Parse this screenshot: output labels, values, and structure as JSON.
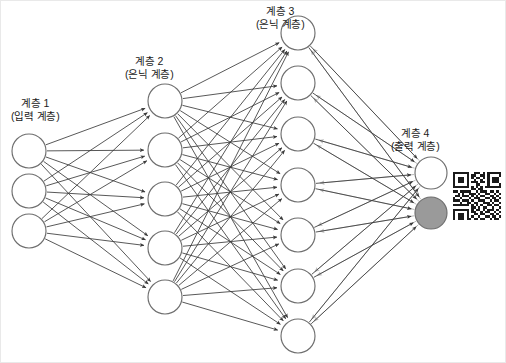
{
  "diagram": {
    "title_alt": "",
    "background": "#ffffff",
    "frame_color": "#e9e9e9",
    "node_stroke": "#6e6e6e",
    "node_fill": "#ffffff",
    "node_fill_highlight": "#9a9a9a",
    "forward_edge_color": "#3a3a3a",
    "backward_edge_color": "#b9b9b9",
    "labels": [
      {
        "id": "layer-1-label",
        "line1": "계층 1",
        "line2": "(입력 계층)",
        "x": 10,
        "y": 96
      },
      {
        "id": "layer-2-label",
        "line1": "계층 2",
        "line2": "(은닉 계층)",
        "x": 124,
        "y": 54
      },
      {
        "id": "layer-3-label",
        "line1": "계층 3",
        "line2": "(은닉 계층)",
        "x": 255,
        "y": 4
      },
      {
        "id": "layer-4-label",
        "line1": "계층 4",
        "line2": "(출력 계층)",
        "x": 390,
        "y": 126
      }
    ],
    "layers": [
      {
        "name": "input-layer",
        "index": 1,
        "role": "입력 계층",
        "node_count": 3,
        "cx": 28,
        "radius": 17,
        "node_ys": [
          150,
          190,
          230
        ],
        "highlight_indices": []
      },
      {
        "name": "hidden-layer-2",
        "index": 2,
        "role": "은닉 계층",
        "node_count": 5,
        "cx": 164,
        "radius": 17,
        "node_ys": [
          100,
          149,
          198,
          247,
          296
        ],
        "highlight_indices": []
      },
      {
        "name": "hidden-layer-3",
        "index": 3,
        "role": "은닉 계층",
        "node_count": 7,
        "cx": 297,
        "radius": 17,
        "node_ys": [
          32,
          82,
          133,
          184,
          234,
          285,
          335
        ],
        "highlight_indices": []
      },
      {
        "name": "output-layer",
        "index": 4,
        "role": "출력 계층",
        "node_count": 2,
        "cx": 430,
        "radius": 16,
        "node_ys": [
          172,
          212
        ],
        "highlight_indices": [
          1
        ]
      }
    ],
    "edge_groups": [
      {
        "id": "input-to-hidden2",
        "from": 0,
        "to": 1,
        "direction": "forward",
        "color": "#3a3a3a"
      },
      {
        "id": "hidden2-to-hidden3",
        "from": 1,
        "to": 2,
        "direction": "forward",
        "color": "#3a3a3a"
      },
      {
        "id": "hidden3-to-output",
        "from": 2,
        "to": 3,
        "direction": "forward",
        "color": "#3a3a3a"
      },
      {
        "id": "output-to-hidden3-feedback",
        "from": 3,
        "to": 2,
        "direction": "backward",
        "color": "#b9b9b9"
      }
    ],
    "qr_code": {
      "name": "qr-code",
      "x": 452,
      "y": 168,
      "size": 48,
      "modules": 21,
      "dark_color": "#1a1a1a",
      "light_color": "#ffffff",
      "matrix": [
        "111111100111010111111",
        "100000101100110100001",
        "101110101011010101110",
        "101110100100100101110",
        "101110101110110101110",
        "100000100011000100001",
        "111111101010101111111",
        "000000001101100000000",
        "110111110010111011010",
        "001010011101001100101",
        "011011101010110011010",
        "100100010111001101101",
        "111011101001110010110",
        "000100110110011101001",
        "111111101010100110110",
        "000000001101011001001",
        "111111101011010111010",
        "100000101100101100101",
        "101110100110110011010",
        "101110101001001101101",
        "101110110110110010110"
      ]
    }
  }
}
